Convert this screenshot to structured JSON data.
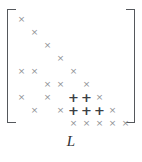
{
  "figure": {
    "caption": "L",
    "symbols": {
      "original": "×",
      "fill_in": "+"
    },
    "colors": {
      "original": "#8e9195",
      "fill_in": "#3c4044",
      "bracket": "#55585c",
      "caption": "#2e3134",
      "background": "#ffffff"
    }
  },
  "matrix": {
    "rows": 9,
    "cols": 9,
    "origin_x": 15,
    "origin_y": 13,
    "cell_w": 13,
    "cell_h": 13,
    "entries": [
      {
        "row": 1,
        "col": 1,
        "symbol": "×",
        "kind": "original"
      },
      {
        "row": 2,
        "col": 2,
        "symbol": "×",
        "kind": "original"
      },
      {
        "row": 3,
        "col": 3,
        "symbol": "×",
        "kind": "original"
      },
      {
        "row": 4,
        "col": 4,
        "symbol": "×",
        "kind": "original"
      },
      {
        "row": 5,
        "col": 1,
        "symbol": "×",
        "kind": "original"
      },
      {
        "row": 5,
        "col": 2,
        "symbol": "×",
        "kind": "original"
      },
      {
        "row": 5,
        "col": 5,
        "symbol": "×",
        "kind": "original"
      },
      {
        "row": 6,
        "col": 3,
        "symbol": "×",
        "kind": "original"
      },
      {
        "row": 6,
        "col": 4,
        "symbol": "×",
        "kind": "original"
      },
      {
        "row": 6,
        "col": 6,
        "symbol": "×",
        "kind": "original"
      },
      {
        "row": 7,
        "col": 1,
        "symbol": "×",
        "kind": "original"
      },
      {
        "row": 7,
        "col": 3,
        "symbol": "×",
        "kind": "original"
      },
      {
        "row": 7,
        "col": 5,
        "symbol": "+",
        "kind": "fill_in"
      },
      {
        "row": 7,
        "col": 6,
        "symbol": "+",
        "kind": "fill_in"
      },
      {
        "row": 7,
        "col": 7,
        "symbol": "×",
        "kind": "original"
      },
      {
        "row": 8,
        "col": 2,
        "symbol": "×",
        "kind": "original"
      },
      {
        "row": 8,
        "col": 4,
        "symbol": "×",
        "kind": "original"
      },
      {
        "row": 8,
        "col": 5,
        "symbol": "+",
        "kind": "fill_in"
      },
      {
        "row": 8,
        "col": 6,
        "symbol": "+",
        "kind": "fill_in"
      },
      {
        "row": 8,
        "col": 7,
        "symbol": "+",
        "kind": "fill_in"
      },
      {
        "row": 8,
        "col": 8,
        "symbol": "×",
        "kind": "original"
      },
      {
        "row": 9,
        "col": 5,
        "symbol": "×",
        "kind": "original"
      },
      {
        "row": 9,
        "col": 6,
        "symbol": "×",
        "kind": "original"
      },
      {
        "row": 9,
        "col": 7,
        "symbol": "×",
        "kind": "original"
      },
      {
        "row": 9,
        "col": 8,
        "symbol": "×",
        "kind": "original"
      },
      {
        "row": 9,
        "col": 9,
        "symbol": "×",
        "kind": "original"
      }
    ]
  }
}
